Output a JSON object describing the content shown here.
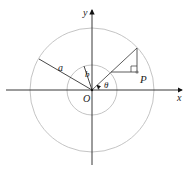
{
  "diagram": {
    "labels": {
      "x_axis": "x",
      "y_axis": "y",
      "origin": "O",
      "outer_radius": "a",
      "inner_radius": "b",
      "angle": "θ",
      "point": "P"
    },
    "colors": {
      "axis": "#222222",
      "circle": "#bdbdbd",
      "line": "#333333",
      "point": "#777777"
    }
  }
}
